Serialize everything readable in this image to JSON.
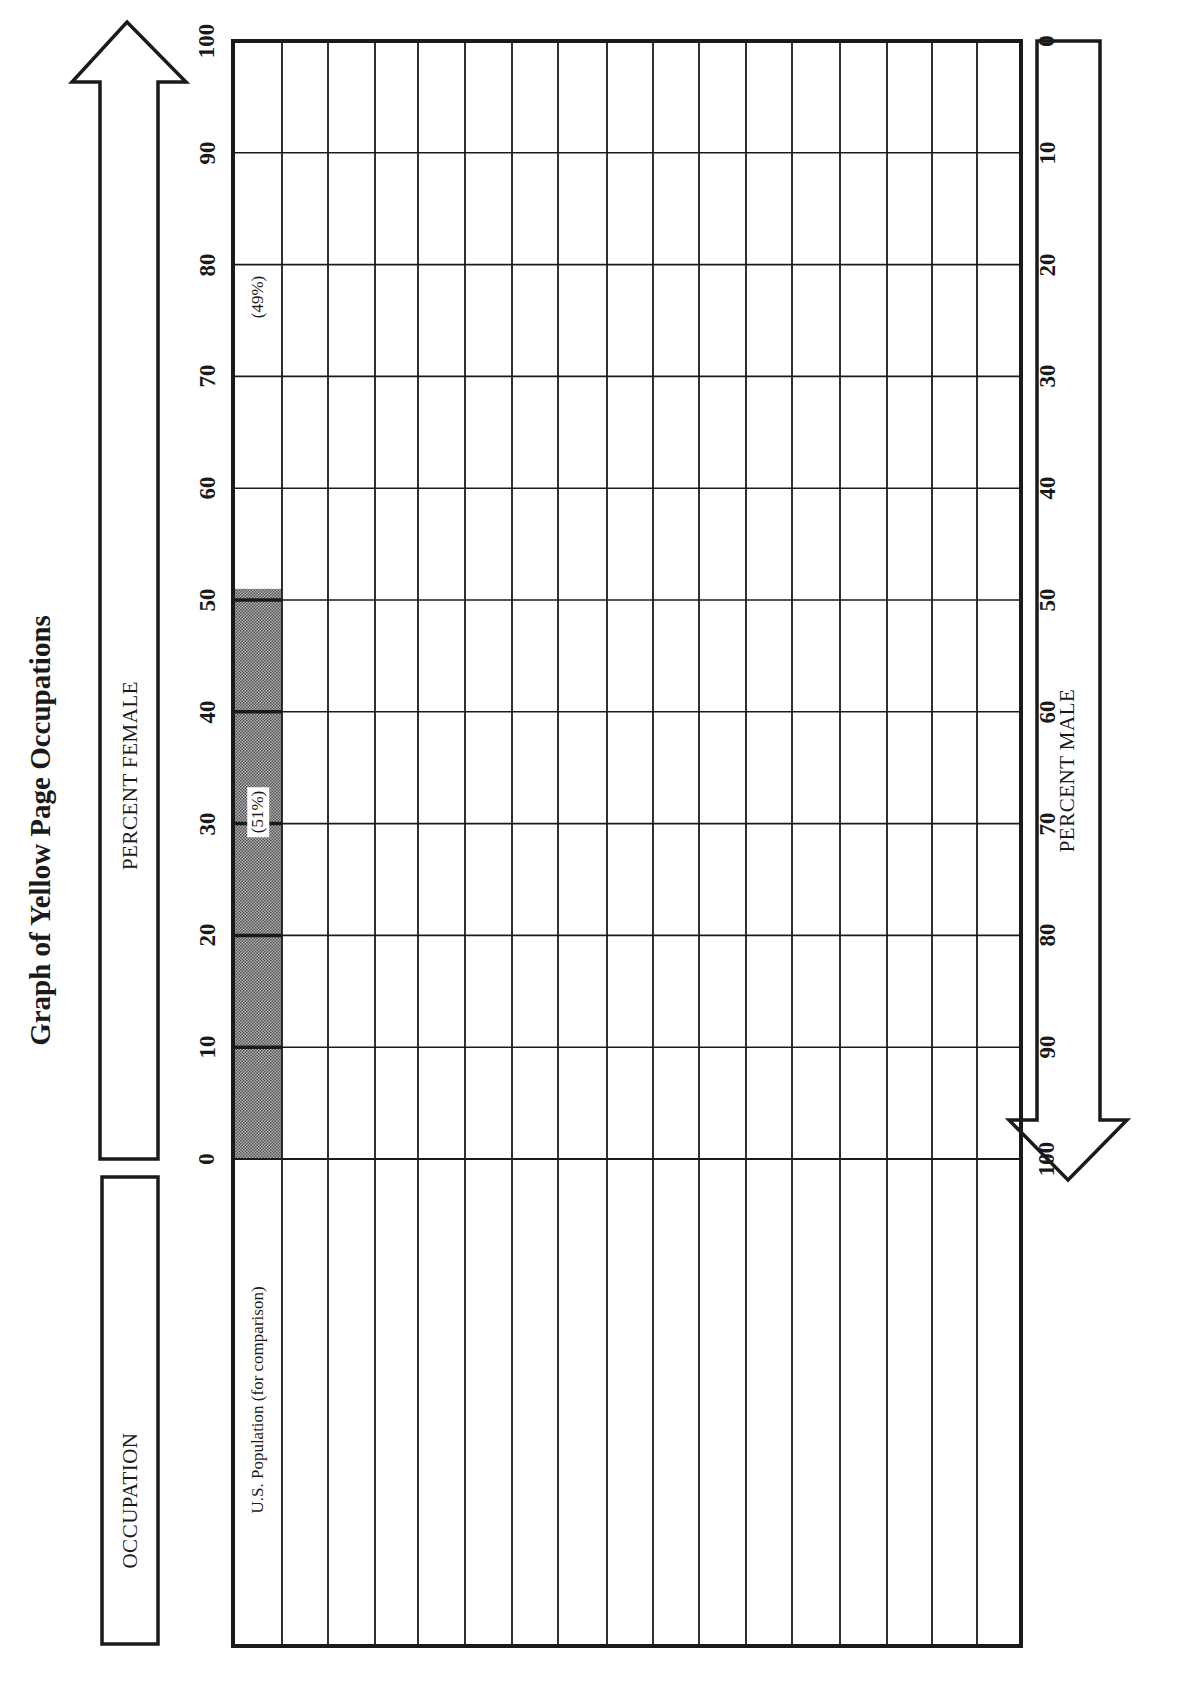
{
  "title": "Graph of Yellow Page Occupations",
  "labels": {
    "occupation": "OCCUPATION",
    "percent_female": "PERCENT FEMALE",
    "percent_male": "PERCENT MALE"
  },
  "female_ticks": [
    "0",
    "10",
    "20",
    "30",
    "40",
    "50",
    "60",
    "70",
    "80",
    "90",
    "100"
  ],
  "male_ticks": [
    "100",
    "90",
    "80",
    "70",
    "60",
    "50",
    "40",
    "30",
    "20",
    "10",
    "0"
  ],
  "rows": [
    {
      "label": "U.S. Population (for comparison)",
      "female_pct": 51,
      "female_label": "(51%)",
      "male_label": "(49%)"
    },
    {
      "label": ""
    },
    {
      "label": ""
    },
    {
      "label": ""
    },
    {
      "label": ""
    },
    {
      "label": ""
    },
    {
      "label": ""
    },
    {
      "label": ""
    },
    {
      "label": ""
    },
    {
      "label": ""
    },
    {
      "label": ""
    },
    {
      "label": ""
    },
    {
      "label": ""
    },
    {
      "label": ""
    },
    {
      "label": ""
    },
    {
      "label": ""
    },
    {
      "label": ""
    }
  ],
  "colors": {
    "ink": "#1a1a1a",
    "bar_fill": "#8a8a8a",
    "paper": "#ffffff"
  },
  "chart_data": {
    "type": "bar",
    "title": "Graph of Yellow Page Occupations",
    "orientation": "horizontal (page rotated 90°)",
    "xlabel": "PERCENT FEMALE (left-to-right) / PERCENT MALE (inverse)",
    "ylabel": "OCCUPATION",
    "categories": [
      "U.S. Population (for comparison)",
      "",
      "",
      "",
      "",
      "",
      "",
      "",
      "",
      "",
      "",
      "",
      "",
      "",
      "",
      "",
      ""
    ],
    "series": [
      {
        "name": "Percent Female",
        "values": [
          51,
          null,
          null,
          null,
          null,
          null,
          null,
          null,
          null,
          null,
          null,
          null,
          null,
          null,
          null,
          null,
          null
        ]
      },
      {
        "name": "Percent Male",
        "values": [
          49,
          null,
          null,
          null,
          null,
          null,
          null,
          null,
          null,
          null,
          null,
          null,
          null,
          null,
          null,
          null,
          null
        ]
      }
    ],
    "annotations": [
      "(51%)",
      "(49%)"
    ],
    "xlim": [
      0,
      100
    ],
    "x_ticks_female": [
      0,
      10,
      20,
      30,
      40,
      50,
      60,
      70,
      80,
      90,
      100
    ],
    "x_ticks_male": [
      100,
      90,
      80,
      70,
      60,
      50,
      40,
      30,
      20,
      10,
      0
    ],
    "grid": true
  }
}
